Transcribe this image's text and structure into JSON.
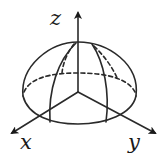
{
  "diagram": {
    "colors": {
      "stroke": "#2a2a2a",
      "background": "#ffffff"
    },
    "axes": [
      {
        "name": "x",
        "label": "x"
      },
      {
        "name": "y",
        "label": "y"
      },
      {
        "name": "z",
        "label": "z"
      }
    ]
  }
}
